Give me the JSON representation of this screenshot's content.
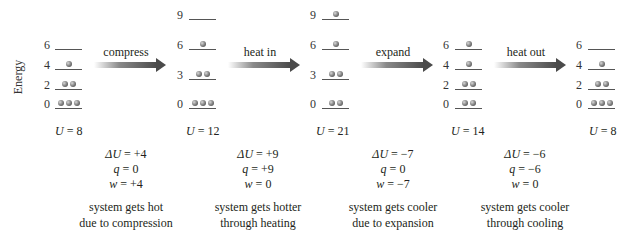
{
  "axis": {
    "label": "Energy"
  },
  "states": [
    {
      "id": "state-1",
      "levels": [
        {
          "value": "6",
          "balls": 0
        },
        {
          "value": "4",
          "balls": 1
        },
        {
          "value": "2",
          "balls": 2
        },
        {
          "value": "0",
          "balls": 3
        }
      ],
      "u_label": "U = 8",
      "u_var": "U",
      "u_value": "= 8"
    },
    {
      "id": "state-2",
      "levels": [
        {
          "value": "9",
          "balls": 0
        },
        {
          "value": "6",
          "balls": 1
        },
        {
          "value": "3",
          "balls": 2
        },
        {
          "value": "0",
          "balls": 3
        }
      ],
      "u_var": "U",
      "u_value": "= 12"
    },
    {
      "id": "state-3",
      "levels": [
        {
          "value": "9",
          "balls": 1
        },
        {
          "value": "6",
          "balls": 1
        },
        {
          "value": "3",
          "balls": 2
        },
        {
          "value": "0",
          "balls": 2
        }
      ],
      "u_var": "U",
      "u_value": "= 21"
    },
    {
      "id": "state-4",
      "levels": [
        {
          "value": "6",
          "balls": 1
        },
        {
          "value": "4",
          "balls": 1
        },
        {
          "value": "2",
          "balls": 2
        },
        {
          "value": "0",
          "balls": 2
        }
      ],
      "u_var": "U",
      "u_value": "= 14"
    },
    {
      "id": "state-5",
      "levels": [
        {
          "value": "6",
          "balls": 0
        },
        {
          "value": "4",
          "balls": 1
        },
        {
          "value": "2",
          "balls": 2
        },
        {
          "value": "0",
          "balls": 3
        }
      ],
      "u_var": "U",
      "u_value": "= 8"
    }
  ],
  "processes": [
    {
      "arrow_label": "compress",
      "dU_var": "ΔU",
      "dU_value": "= +4",
      "q_var": "q",
      "q_value": "= 0",
      "w_var": "w",
      "w_value": "= +4",
      "desc_line1": "system gets hot",
      "desc_line2": "due to compression"
    },
    {
      "arrow_label": "heat in",
      "dU_var": "ΔU",
      "dU_value": "= +9",
      "q_var": "q",
      "q_value": "= +9",
      "w_var": "w",
      "w_value": "= 0",
      "desc_line1": "system gets hotter",
      "desc_line2": "through heating"
    },
    {
      "arrow_label": "expand",
      "dU_var": "ΔU",
      "dU_value": "= −7",
      "q_var": "q",
      "q_value": "= 0",
      "w_var": "w",
      "w_value": "= −7",
      "desc_line1": "system gets cooler",
      "desc_line2": "due to expansion"
    },
    {
      "arrow_label": "heat out",
      "dU_var": "ΔU",
      "dU_value": "= −6",
      "q_var": "q",
      "q_value": "= −6",
      "w_var": "w",
      "w_value": "= 0",
      "desc_line1": "system gets cooler",
      "desc_line2": "through cooling"
    }
  ],
  "colors": {
    "line": "#555555",
    "arrow": "#4a4a4a",
    "ball": "#5a5a5a",
    "text": "#231f20"
  }
}
